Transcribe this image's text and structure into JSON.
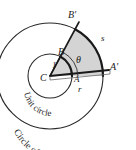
{
  "figure": {
    "type": "geometry-diagram",
    "title_caption": "Circle of radius r",
    "inner_caption": "Unit circle",
    "background": "#ffffff",
    "stroke_color": "#2b2b2b",
    "sector_fill": "#d6d6d6"
  },
  "labels": {
    "center": "C",
    "unit_point_a": "A",
    "unit_point_b": "B",
    "outer_point_a": "A′",
    "outer_point_b": "B′",
    "angle": "θ",
    "unit_radius": "1",
    "outer_radius": "r",
    "arc_length": "s"
  },
  "captions": {
    "unit_circle": "Unit circle",
    "outer_circle": "Circle of radius r"
  },
  "geometry": {
    "center_x": 50,
    "center_y": 76,
    "unit_radius_px": 22,
    "outer_radius_px": 53,
    "angle_start_deg": 0,
    "angle_end_deg": 62
  }
}
